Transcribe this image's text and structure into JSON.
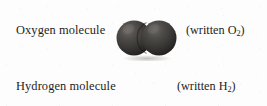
{
  "diagram": {
    "background_color": "#fdfdfd",
    "text_color": "#1f1d1c",
    "rows": [
      {
        "id": "oxygen",
        "label": "Oxygen molecule",
        "note_prefix": "(written O",
        "note_subscript": "2",
        "note_suffix": ")",
        "note_full": "(written O2)",
        "molecule": {
          "name": "oxygen-molecule",
          "atom_count": 2,
          "atom_symbol": "O",
          "atom_color": "#3a3836",
          "atom_highlight_color": "#6d6a67",
          "atom_shadow_color": "#1d1b1a",
          "atom_radius_px": 17,
          "formula": "O2"
        }
      },
      {
        "id": "hydrogen",
        "label": "Hydrogen molecule",
        "note_prefix": "(written H",
        "note_subscript": "2",
        "note_suffix": ")",
        "note_full": "(written H2)",
        "molecule": {
          "name": "hydrogen-molecule",
          "atom_count": 2,
          "atom_symbol": "H",
          "atom_color": "#d6d4d1",
          "atom_highlight_color": "#fbfbfa",
          "atom_shadow_color": "#a9a6a2",
          "atom_radius_px": 11,
          "formula": "H2"
        }
      }
    ]
  }
}
